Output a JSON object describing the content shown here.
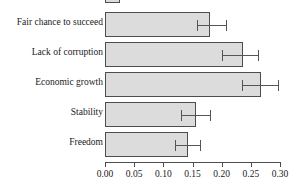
{
  "chart_data": {
    "type": "bar",
    "orientation": "horizontal",
    "title": "",
    "subtitle": "",
    "xlabel": "",
    "ylabel": "",
    "xlim": [
      0.0,
      0.3
    ],
    "ylim": null,
    "grid": false,
    "legend": null,
    "xticks": [
      0.0,
      0.05,
      0.1,
      0.15,
      0.2,
      0.25,
      0.3
    ],
    "xtick_labels": [
      "0.00",
      "0.05",
      "0.10",
      "0.15",
      "0.20",
      "0.25",
      "0.30"
    ],
    "categories": [
      "Fair chance to succeed",
      "Lack of corruption",
      "Economic growth",
      "Stability",
      "Freedom"
    ],
    "values": [
      0.18,
      0.236,
      0.267,
      0.156,
      0.142
    ],
    "error_low": [
      0.158,
      0.2,
      0.235,
      0.13,
      0.12
    ],
    "error_high": [
      0.207,
      0.262,
      0.297,
      0.18,
      0.163
    ],
    "bar_fill_color": "#dcdcdc",
    "bar_edge_color": "#4d4d4d",
    "error_bar_color": "#555555",
    "note_clipped_top_bar": "partial bar clipped at top edge of image"
  }
}
